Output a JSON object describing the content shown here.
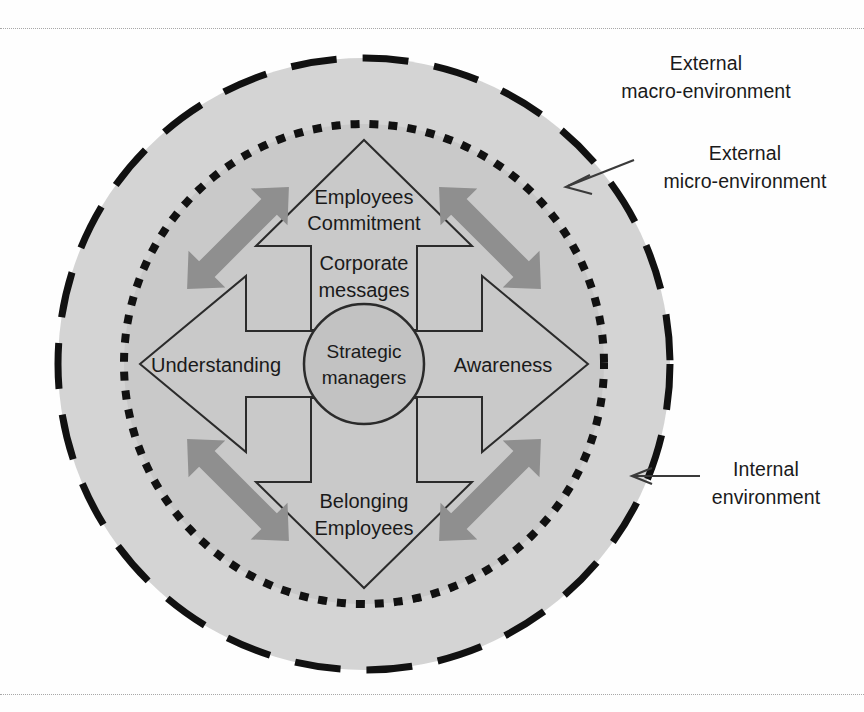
{
  "diagram": {
    "center": {
      "line1": "Strategic",
      "line2": "managers"
    },
    "arrows": [
      {
        "id": "up",
        "direction": "up",
        "head_line1": "Employees",
        "head_line2": "Commitment",
        "shaft_line1": "Corporate",
        "shaft_line2": "messages"
      },
      {
        "id": "right",
        "direction": "right",
        "head_line1": "Awareness",
        "head_line2": "",
        "shaft_line1": "",
        "shaft_line2": ""
      },
      {
        "id": "down",
        "direction": "down",
        "head_line1": "Belonging",
        "head_line2": "Employees",
        "shaft_line1": "",
        "shaft_line2": ""
      },
      {
        "id": "left",
        "direction": "left",
        "head_line1": "Understanding",
        "head_line2": "",
        "shaft_line1": "",
        "shaft_line2": ""
      }
    ],
    "callouts": [
      {
        "id": "external-macro",
        "line1": "External",
        "line2": "macro-environment",
        "has_leader": false
      },
      {
        "id": "external-micro",
        "line1": "External",
        "line2": "micro-environment",
        "has_leader": true
      },
      {
        "id": "internal",
        "line1": "Internal",
        "line2": "environment",
        "has_leader": true
      }
    ],
    "exchange_arrows_count": 4,
    "colors": {
      "outer_fill": "#d4d4d4",
      "inner_fill": "#c4c4c4",
      "arrow_fill": "#c9c9c9",
      "exchange_arrow_fill": "#8c8c8c",
      "stroke": "#1a1a1a",
      "text": "#1a1a1a",
      "page_rule": "#a8a8a8"
    }
  }
}
